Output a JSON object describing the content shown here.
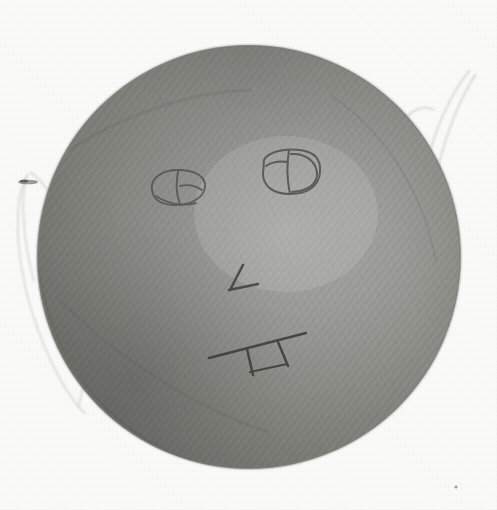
{
  "page": {
    "width": 497,
    "height": 510,
    "background_color": "#fdfdfc",
    "medium": "pencil drawing on paper (scanned)"
  },
  "caption": {
    "text": "Scale of",
    "note": "cropped at top edge of scan, only lower halves of glyphs visible",
    "color": "#2c2c2c"
  },
  "subject": {
    "title": "Shaded sphere with drawn face",
    "shape_name": "sphere",
    "center_x": 249,
    "center_y": 257,
    "radius": 212,
    "shading": "graphite hatching, light source upper-right-of-center",
    "colors": {
      "highlight": "#b4b4b2",
      "midtone": "#8e8e8c",
      "shadow": "#6a6a69",
      "edge_shadow": "#5e5e5d",
      "outline": "#6f6f6e"
    }
  },
  "face": {
    "eye_left": {
      "label": "left eye",
      "center_x": 176,
      "center_y": 188,
      "rx": 26,
      "ry": 16,
      "detail": "rough oval with vertical pupil stroke"
    },
    "eye_right": {
      "label": "right eye",
      "center_x": 291,
      "center_y": 173,
      "rx": 29,
      "ry": 19,
      "detail": "rounded-square outline with vertical pupil stroke"
    },
    "nose": {
      "label": "nose",
      "detail": "short V / check-mark stroke",
      "apex_x": 232,
      "apex_y": 291
    },
    "mouth": {
      "label": "mouth",
      "detail": "diagonal line with two vertical tooth strokes",
      "start_x": 212,
      "start_y": 356,
      "end_x": 300,
      "end_y": 334
    }
  },
  "artifacts": [
    {
      "name": "wire-loop-left",
      "label": "faint wire loop, left margin",
      "side": "left",
      "color": "#d8d8d6"
    },
    {
      "name": "wire-strands-right",
      "label": "faint wire strands, upper right margin",
      "side": "right",
      "color": "#d4d4d2"
    },
    {
      "name": "speck-bottom-right",
      "label": "small ink speck near lower right",
      "x": 456,
      "y": 487,
      "color": "#8d8d8b"
    }
  ]
}
